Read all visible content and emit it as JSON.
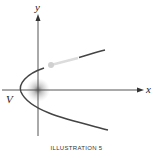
{
  "figure": {
    "axis_labels": {
      "x": "x",
      "y": "y"
    },
    "vertex_label": "V",
    "caption": "ILLUSTRATION 5",
    "colors": {
      "curve": "#444444",
      "axis": "#555555",
      "highlight_segment": "#dddddd",
      "focus_glow": "#888888"
    }
  }
}
